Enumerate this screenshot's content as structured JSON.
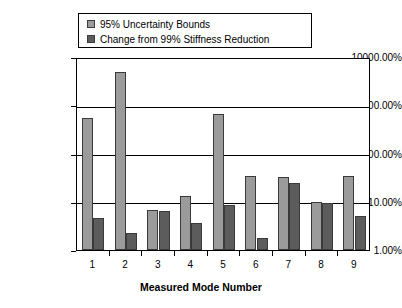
{
  "chart_data": {
    "type": "bar",
    "title": "",
    "xlabel": "Measured Mode Number",
    "ylabel": "",
    "yscale": "log",
    "ylim": [
      1,
      10000
    ],
    "grid": true,
    "legend_position": "top",
    "categories": [
      "1",
      "2",
      "3",
      "4",
      "5",
      "6",
      "7",
      "8",
      "9"
    ],
    "ytick_labels": [
      "10000.00%",
      "1000.00%",
      "100.00%",
      "10.00%",
      "1.00%"
    ],
    "ytick_values": [
      10000,
      1000,
      100,
      10,
      1
    ],
    "series": [
      {
        "name": "95% Uncertainty Bounds",
        "color": "#9b9b9b",
        "values": [
          550,
          5000,
          6.6,
          13,
          650,
          35,
          33,
          10,
          35
        ]
      },
      {
        "name": "Change from 99% Stiffness Reduction",
        "color": "#5c5c5c",
        "values": [
          4.5,
          2.3,
          6.3,
          3.6,
          8.5,
          1.8,
          24,
          9.5,
          5
        ]
      }
    ]
  },
  "legend": {
    "items": [
      {
        "label": "95% Uncertainty Bounds",
        "color": "#9b9b9b"
      },
      {
        "label": "Change from 99% Stiffness Reduction",
        "color": "#5c5c5c"
      }
    ]
  },
  "axes": {
    "x_title": "Measured Mode Number"
  }
}
